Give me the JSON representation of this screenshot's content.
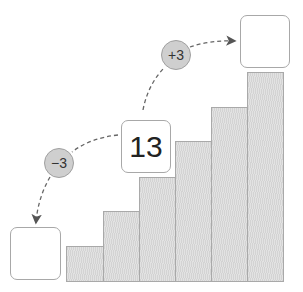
{
  "diagram": {
    "center_box": {
      "value": "13"
    },
    "left_box": {
      "value": ""
    },
    "right_box": {
      "value": ""
    },
    "minus_step": {
      "label": "−3"
    },
    "plus_step": {
      "label": "+3"
    },
    "bars": {
      "count": 6,
      "description": "staircase of increasing bars"
    },
    "colors": {
      "bar_fill": "#dcdcdc",
      "circle_fill": "#cfcfcf",
      "border": "#a8a8a8",
      "arrow": "#555555"
    }
  }
}
